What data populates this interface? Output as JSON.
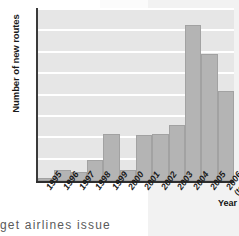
{
  "chart_data": {
    "type": "bar",
    "title": "",
    "xlabel": "Year",
    "ylabel": "Number of new routes",
    "categories": [
      "1995",
      "1996",
      "1997",
      "1998",
      "1999",
      "2000",
      "2001",
      "2002",
      "2003",
      "2004",
      "2005",
      "2006"
    ],
    "category_sublabels": [
      "",
      "",
      "",
      "",
      "",
      "",
      "",
      "",
      "",
      "",
      "",
      "(to July)"
    ],
    "values": [
      1.5,
      5,
      4,
      10,
      22,
      5,
      21.5,
      22,
      26,
      73,
      59.5,
      42
    ],
    "ylim": [
      0,
      80
    ],
    "yticks": [
      0,
      10,
      20,
      30,
      40,
      50,
      60,
      70,
      80
    ],
    "grid": true,
    "legend": false,
    "bar_color": "#b4b4b4",
    "plot_background": "#e6e6e6",
    "gridline_color": "#ffffff"
  },
  "page": {
    "body_text_fragment": "get  airlines  issue"
  }
}
